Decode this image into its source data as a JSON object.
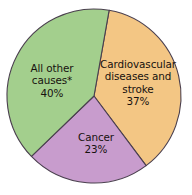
{
  "chart_data": {
    "type": "pie",
    "title": "",
    "subtitle": "",
    "xlabel": "",
    "ylabel": "",
    "legend_position": "none",
    "grid": false,
    "labels_inside_slices": true,
    "categories": [
      "Cardiovascular diseases and stroke",
      "Cancer",
      "All other causes*"
    ],
    "values": [
      37,
      23,
      40
    ],
    "value_suffix": "%",
    "colors": [
      "#f3c684",
      "#c89ccd",
      "#a3cf8d"
    ],
    "slices": [
      {
        "name": "cardiovascular",
        "label_lines": [
          "Cardiovascular",
          "diseases and",
          "stroke"
        ],
        "percent_text": "37%",
        "value": 37,
        "color": "#f3c684",
        "start_angle_deg": 10,
        "sweep_deg": 133.2
      },
      {
        "name": "cancer",
        "label_lines": [
          "Cancer"
        ],
        "percent_text": "23%",
        "value": 23,
        "color": "#c89ccd",
        "start_angle_deg": 143.2,
        "sweep_deg": 82.8
      },
      {
        "name": "all-other-causes",
        "label_lines": [
          "All other",
          "causes*"
        ],
        "percent_text": "40%",
        "value": 40,
        "color": "#a3cf8d",
        "start_angle_deg": 226,
        "sweep_deg": 144
      }
    ]
  },
  "chart": {
    "background_color": "#ffffff",
    "outline_color": "#4a3f4e",
    "text_color": "#17120f",
    "center_x": 94,
    "center_y": 96,
    "radius": 87
  },
  "labels": {
    "cardiovascular": {
      "line1": "Cardiovascular",
      "line2": "diseases and",
      "line3": "stroke",
      "percent": "37%"
    },
    "other": {
      "line1": "All other",
      "line2": "causes*",
      "percent": "40%"
    },
    "cancer": {
      "line1": "Cancer",
      "percent": "23%"
    }
  }
}
